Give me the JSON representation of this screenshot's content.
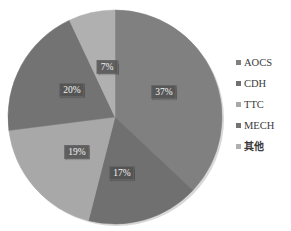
{
  "chart_data": {
    "type": "pie",
    "title": "",
    "categories": [
      "AOCS",
      "CDH",
      "TTC",
      "MECH",
      "其他"
    ],
    "values": [
      37,
      17,
      19,
      20,
      7
    ],
    "unit": "%",
    "data_labels": [
      "37%",
      "17%",
      "19%",
      "20%",
      "7%"
    ],
    "colors": [
      "#808080",
      "#707070",
      "#a8a8a8",
      "#737373",
      "#b0b0b0"
    ],
    "legend_position": "right",
    "grid": false,
    "start_angle_deg": 0,
    "direction": "clockwise"
  },
  "legend": {
    "items": [
      {
        "label": "AOCS",
        "color": "#808080",
        "cjk": false
      },
      {
        "label": "CDH",
        "color": "#707070",
        "cjk": false
      },
      {
        "label": "TTC",
        "color": "#a8a8a8",
        "cjk": false
      },
      {
        "label": "MECH",
        "color": "#737373",
        "cjk": false
      },
      {
        "label": "其他",
        "color": "#b0b0b0",
        "cjk": true
      }
    ]
  },
  "slice_labels": [
    {
      "text": "37%",
      "x": 164,
      "y": 92
    },
    {
      "text": "17%",
      "x": 122,
      "y": 173
    },
    {
      "text": "19%",
      "x": 77,
      "y": 152
    },
    {
      "text": "20%",
      "x": 72,
      "y": 90
    },
    {
      "text": "7%",
      "x": 107,
      "y": 67
    }
  ],
  "geometry": {
    "cx": 115,
    "cy": 117,
    "r": 107
  }
}
